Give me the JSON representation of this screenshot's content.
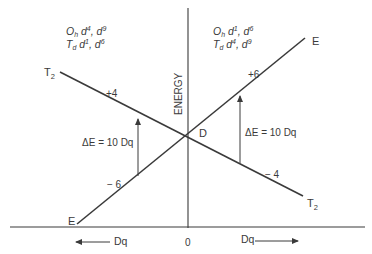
{
  "diagram": {
    "axis_label": "ENERGY",
    "origin_label": "0",
    "left_axis_label": "Dq",
    "right_axis_label": "Dq",
    "center_label": "D",
    "left_region": {
      "line1_main": "O",
      "line1_sub": "h",
      "line1_conf": "d",
      "line1_sup_a": "4",
      "line1_conf_b": "d",
      "line1_sup_b": "9",
      "line2_main": "T",
      "line2_sub": "d",
      "line2_conf": "d",
      "line2_sup_a": "1",
      "line2_conf_b": "d",
      "line2_sup_b": "6"
    },
    "right_region": {
      "line1_main": "O",
      "line1_sub": "h",
      "line1_conf": "d",
      "line1_sup_a": "1",
      "line1_conf_b": "d",
      "line1_sup_b": "6",
      "line2_main": "T",
      "line2_sub": "d",
      "line2_conf": "d",
      "line2_sup_a": "4",
      "line2_conf_b": "d",
      "line2_sup_b": "9"
    },
    "lines": {
      "t2": {
        "label_main": "T",
        "label_sub": "2",
        "left_value": "+4",
        "right_value": "− 4"
      },
      "e": {
        "label": "E",
        "left_value": "− 6",
        "right_value": "+6"
      }
    },
    "splitting_label_left": "ΔE = 10 Dq",
    "splitting_label_right": "ΔE = 10 Dq",
    "stroke_color": "#3a3a3a"
  }
}
